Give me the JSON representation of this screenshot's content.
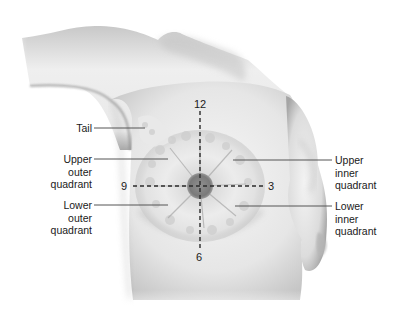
{
  "figure": {
    "colors": {
      "skin_light": "#f2f2f2",
      "skin_shadow": "#9a9a9a",
      "gland": "#e4e4e4",
      "areola": "#7d7d7d",
      "leader_line": "#555555",
      "text": "#1a1a1a"
    }
  },
  "labels": {
    "tail": "Tail",
    "upper_outer": [
      "Upper",
      "outer",
      "quadrant"
    ],
    "lower_outer": [
      "Lower",
      "outer",
      "quadrant"
    ],
    "upper_inner": [
      "Upper",
      "inner",
      "quadrant"
    ],
    "lower_inner": [
      "Lower",
      "inner",
      "quadrant"
    ]
  },
  "clock_positions": {
    "top": "12",
    "right": "3",
    "bottom": "6",
    "left": "9"
  }
}
